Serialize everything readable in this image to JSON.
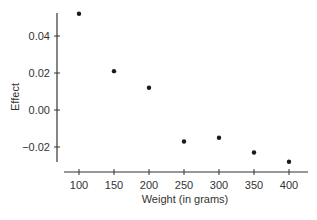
{
  "chart_data": {
    "type": "scatter",
    "title": "",
    "xlabel": "Weight (in grams)",
    "ylabel": "Effect",
    "x": [
      100,
      150,
      200,
      250,
      300,
      350,
      400
    ],
    "y": [
      0.052,
      0.021,
      0.012,
      -0.017,
      -0.015,
      -0.023,
      -0.028
    ],
    "xticks": [
      100,
      150,
      200,
      250,
      300,
      350,
      400
    ],
    "xtick_labels": [
      "100",
      "150",
      "200",
      "250",
      "300",
      "350",
      "400"
    ],
    "yticks": [
      0.04,
      0.02,
      0.0,
      -0.02
    ],
    "ytick_labels": [
      "0.04",
      "0.02",
      "0.00",
      "−0.02"
    ],
    "xlim": [
      78,
      437
    ],
    "ylim": [
      -0.028,
      0.053
    ],
    "grid": false,
    "legend": null,
    "marker_color": "#1a1a1a",
    "axis_color": "#333333"
  }
}
